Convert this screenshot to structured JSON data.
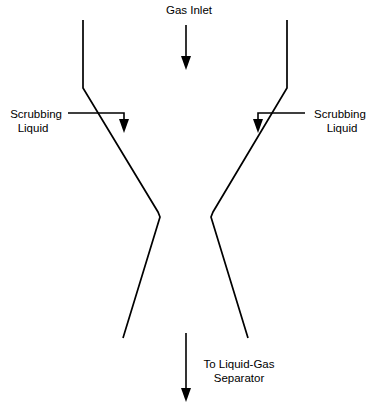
{
  "diagram": {
    "width": 370,
    "height": 407,
    "background_color": "#ffffff",
    "line_color": "#000000",
    "text_color": "#000000"
  },
  "labels": {
    "gas_inlet": "Gas Inlet",
    "scrubbing_liquid_left_line1": "Scrubbing",
    "scrubbing_liquid_left_line2": "Liquid",
    "scrubbing_liquid_right_line1": "Scrubbing",
    "scrubbing_liquid_right_line2": "Liquid",
    "outlet_line1": "To Liquid-Gas",
    "outlet_line2": "Separator"
  },
  "flows": [
    {
      "name": "gas-inlet-flow",
      "label": "Gas Inlet",
      "direction": "down",
      "position": "top-center"
    },
    {
      "name": "scrubbing-liquid-left-flow",
      "label": "Scrubbing Liquid",
      "direction": "right-then-down",
      "position": "left"
    },
    {
      "name": "scrubbing-liquid-right-flow",
      "label": "Scrubbing Liquid",
      "direction": "left-then-down",
      "position": "right"
    },
    {
      "name": "outlet-flow",
      "label": "To Liquid-Gas Separator",
      "direction": "down",
      "position": "bottom-center"
    }
  ],
  "geometry": {
    "left_wall_path": "M 83,20 L 83,88 L 158,212 L 160,217 L 123,338",
    "right_wall_path": "M 287,20 L 287,88 L 213,212 L 211,217 L 248,338",
    "gas_inlet_arrow_line": "M 186,25 L 186,58",
    "gas_inlet_arrow_head": "186,70 181,56 191,56",
    "left_liquid_line": "M 68,113 L 124,113 L 124,120",
    "left_liquid_head": "124,133 119,119 129,119",
    "right_liquid_line": "M 305,113 L 258,113 L 258,120",
    "right_liquid_head": "258,133 253,119 263,119",
    "outlet_arrow_line": "M 186,333 L 186,390",
    "outlet_arrow_head": "186,402 181,388 191,388"
  }
}
